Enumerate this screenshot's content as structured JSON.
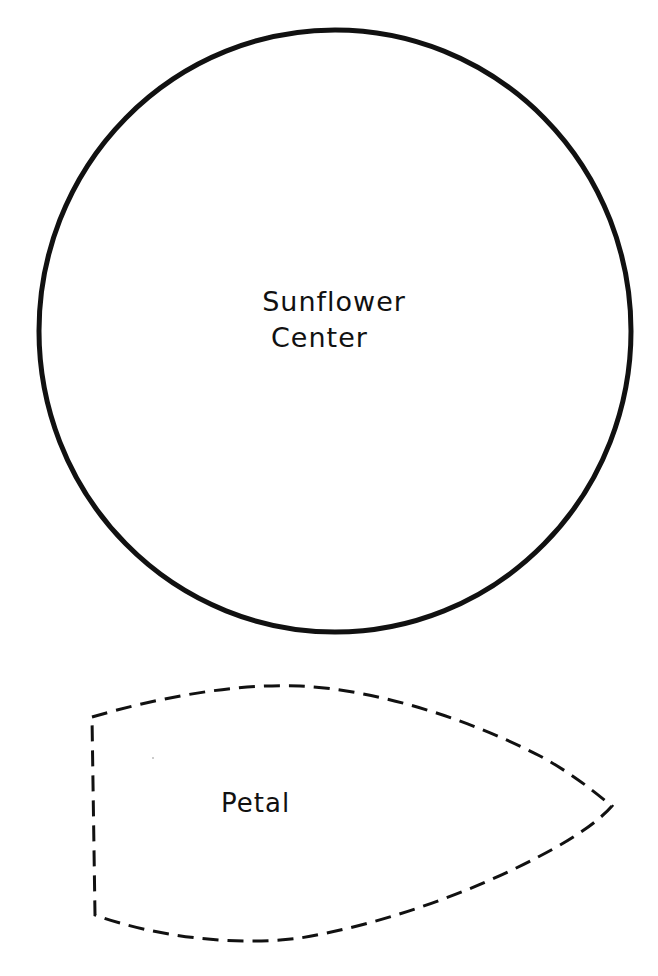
{
  "document": {
    "type": "craft-template",
    "background_color": "#ffffff",
    "ink_color": "#111111"
  },
  "shapes": {
    "sunflower_center": {
      "label_line1": "Sunflower",
      "label_line2": "Center",
      "outline": "solid",
      "shape": "circle"
    },
    "petal": {
      "label": "Petal",
      "outline": "dashed",
      "shape": "petal"
    }
  }
}
